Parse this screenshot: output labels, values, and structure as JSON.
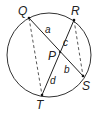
{
  "diagram": {
    "circle": {
      "cx": 49,
      "cy": 55,
      "r": 42,
      "stroke": "#333333"
    },
    "points": {
      "Q": {
        "label": "Q",
        "x": 29,
        "y": 18
      },
      "R": {
        "label": "R",
        "x": 74,
        "y": 20
      },
      "S": {
        "label": "S",
        "x": 83,
        "y": 76
      },
      "T": {
        "label": "T",
        "x": 42,
        "y": 95
      },
      "P": {
        "label": "P",
        "x": 60,
        "y": 52
      }
    },
    "chords": [
      {
        "from": "Q",
        "to": "S",
        "style": "solid"
      },
      {
        "from": "R",
        "to": "T",
        "style": "solid"
      }
    ],
    "dashed_segments": [
      {
        "from": "Q",
        "to": "T",
        "style": "dashed"
      },
      {
        "from": "R",
        "to": "S",
        "style": "dashed"
      }
    ],
    "segment_labels": {
      "a": "a",
      "b": "b",
      "c": "c",
      "d": "d"
    }
  }
}
